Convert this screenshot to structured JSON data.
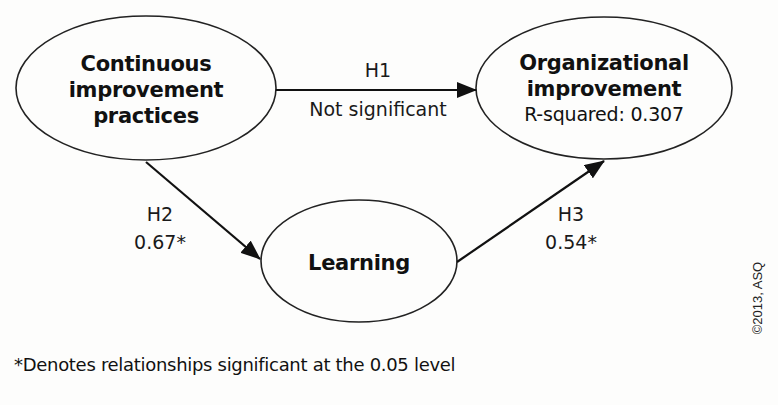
{
  "diagram": {
    "type": "path-model",
    "nodes": {
      "cip": {
        "title_line1": "Continuous",
        "title_line2": "improvement",
        "title_line3": "practices"
      },
      "org": {
        "title_line1": "Organizational",
        "title_line2": "improvement",
        "subtitle": "R-squared: 0.307"
      },
      "learning": {
        "title": "Learning"
      }
    },
    "edges": {
      "h1": {
        "label": "H1",
        "value": "Not significant",
        "from": "Continuous improvement practices",
        "to": "Organizational improvement"
      },
      "h2": {
        "label": "H2",
        "value": "0.67*",
        "from": "Continuous improvement practices",
        "to": "Learning"
      },
      "h3": {
        "label": "H3",
        "value": "0.54*",
        "from": "Learning",
        "to": "Organizational improvement"
      }
    },
    "footnote": "*Denotes relationships significant at the 0.05 level",
    "copyright": "©2013, ASQ"
  },
  "colors": {
    "background": "#fdfdfc",
    "stroke": "#1a1a1a",
    "text": "#111111"
  }
}
